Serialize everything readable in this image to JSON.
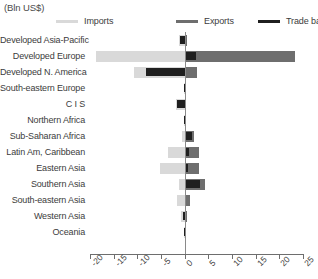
{
  "units_caption": "(Bln US$)",
  "legend": {
    "items": [
      {
        "label": "Imports",
        "color": "#d9d9d9",
        "icon": "line-swatch-icon"
      },
      {
        "label": "Exports",
        "color": "#6e6e6e",
        "icon": "line-swatch-icon"
      },
      {
        "label": "Trade balance",
        "color": "#1f1f1f",
        "icon": "line-swatch-icon"
      }
    ]
  },
  "chart_data": {
    "type": "bar",
    "orientation": "horizontal",
    "title": "",
    "subtitle": "",
    "xlabel": "",
    "ylabel": "",
    "units": "(Bln US$)",
    "xlim": [
      -20,
      25
    ],
    "xticks": [
      -20,
      -15,
      -10,
      -5,
      0,
      5,
      10,
      15,
      20,
      25
    ],
    "xtick_labels": [
      "-20",
      "-15",
      "-10",
      "-5",
      "0",
      "5",
      "10",
      "15",
      "20",
      "25"
    ],
    "grid": false,
    "legend_position": "top",
    "categories": [
      "Developed Asia-Pacific",
      "Developed Europe",
      "Developed N. America",
      "South-eastern Europe",
      "C I S",
      "Northern Africa",
      "Sub-Saharan Africa",
      "Latin Am, Caribbean",
      "Eastern Asia",
      "Southern Asia",
      "South-eastern Asia",
      "Western Asia",
      "Oceania"
    ],
    "series": [
      {
        "name": "Imports",
        "color": "#d9d9d9",
        "values": [
          -1.2,
          -18.7,
          -10.8,
          -0.2,
          -1.9,
          -0.2,
          -0.5,
          -3.6,
          -5.2,
          -1.3,
          -1.6,
          -0.8,
          -0.1
        ]
      },
      {
        "name": "Exports",
        "color": "#6e6e6e",
        "values": [
          0.5,
          23.3,
          2.6,
          0.2,
          0.3,
          0.2,
          2.0,
          3.1,
          3.0,
          4.2,
          1.1,
          0.4,
          0.05
        ]
      },
      {
        "name": "Trade balance",
        "color": "#1f1f1f",
        "values": [
          -0.9,
          2.4,
          -8.2,
          -0.1,
          -1.6,
          -0.1,
          1.5,
          1.0,
          0.8,
          3.2,
          0.3,
          -0.4,
          -0.05
        ]
      }
    ]
  }
}
